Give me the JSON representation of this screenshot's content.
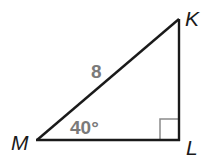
{
  "diagram": {
    "type": "right-triangle",
    "vertices": {
      "K": {
        "label": "K",
        "x": 179,
        "y": 19
      },
      "L": {
        "label": "L",
        "x": 179,
        "y": 140
      },
      "M": {
        "label": "M",
        "x": 37,
        "y": 140
      }
    },
    "hypotenuse_label": "8",
    "angle_M_label": "40°",
    "right_angle_at": "L",
    "colors": {
      "lines": "#1a1a1a",
      "measure_text": "#7a7a7a",
      "right_angle_marker": "#8a8a8a"
    }
  }
}
